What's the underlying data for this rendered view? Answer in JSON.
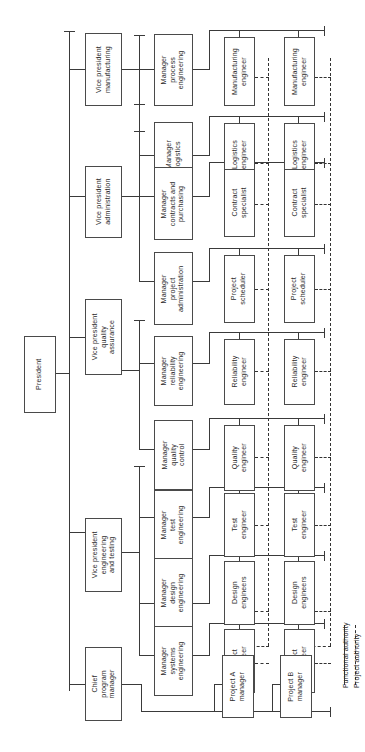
{
  "diagram": {
    "orientation": "rotated-90",
    "colors": {
      "line": "#3a3a3a",
      "box_border": "#4a4a4a",
      "background": "#ffffff",
      "text": "#2b2b2b"
    }
  },
  "executive": {
    "president": "President",
    "chief_program_manager": "Chief\nprogram\nmanager"
  },
  "vice_presidents": [
    {
      "label": "Vice president\nmanufacturing"
    },
    {
      "label": "Vice president\nadministration"
    },
    {
      "label": "Vice president\nquality\nassurance"
    },
    {
      "label": "Vice president\nengineering\nand testing"
    }
  ],
  "functional_rows": [
    {
      "manager": "Manager\nprocess\nengineering",
      "project_a": "Manufacturing\nengineer",
      "project_b": "Manufacturing\nengineer"
    },
    {
      "manager": "Manager\nlogistics",
      "project_a": "Logistics\nengineer",
      "project_b": "Logistics\nengineer"
    },
    {
      "manager": "Manager\ncontracts and\npurchasing",
      "project_a": "Contract\nspecialist",
      "project_b": "Contract\nspecialist"
    },
    {
      "manager": "Manager\nproject\nadministration",
      "project_a": "Project\nscheduler",
      "project_b": "Project\nscheduler"
    },
    {
      "manager": "Manager\nreliability\nengineering",
      "project_a": "Reliability\nengineer",
      "project_b": "Reliability\nengineer"
    },
    {
      "manager": "Manager\nquality\ncontrol",
      "project_a": "Quality\nengineer",
      "project_b": "Quality\nengineer"
    },
    {
      "manager": "Manager\ntest\nengineering",
      "project_a": "Test\nengineer",
      "project_b": "Test\nengineer"
    },
    {
      "manager": "Manager\ndesign\nengineering",
      "project_a": "Design\nengineers",
      "project_b": "Design\nengineers"
    },
    {
      "manager": "Manager\nsystems\nengineering",
      "project_a": "Project\nengineer",
      "project_b": "Project\nengineer"
    }
  ],
  "project_managers": [
    {
      "label": "Project A\nmanager"
    },
    {
      "label": "Project B\nmanager"
    }
  ],
  "legend": {
    "functional": "Functional authority",
    "project": "Project authority"
  }
}
